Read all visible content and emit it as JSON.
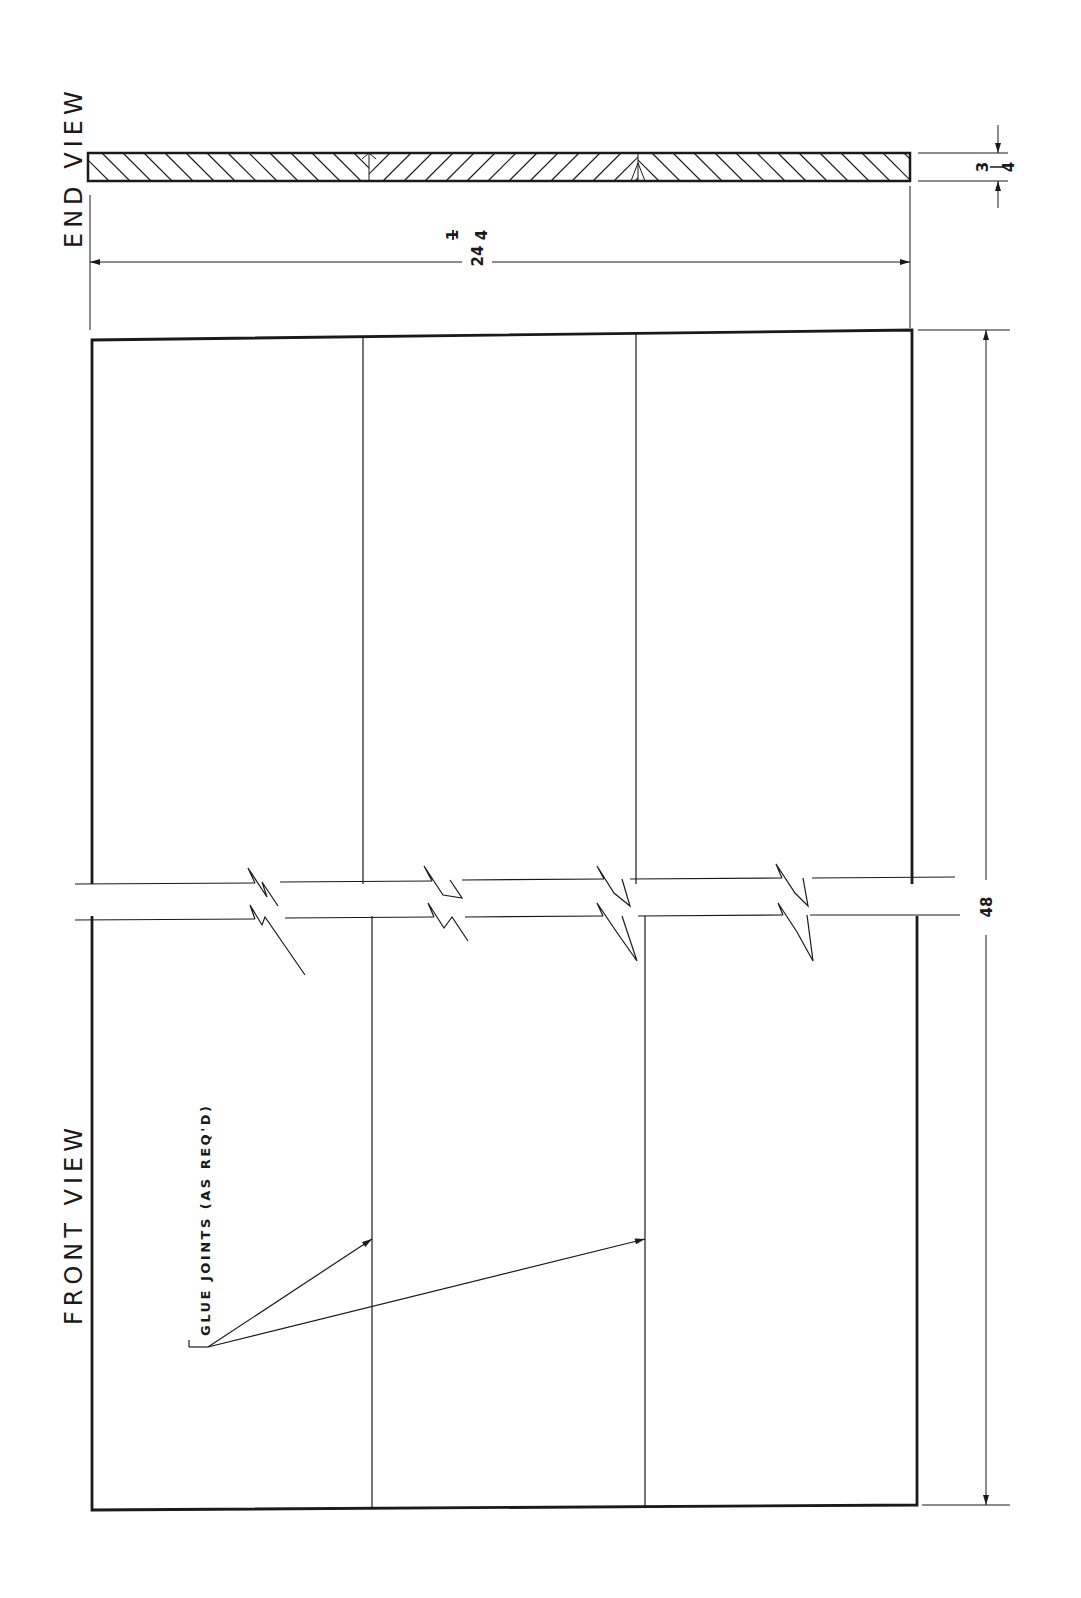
{
  "drawing": {
    "end_view": {
      "title": "END VIEW",
      "width_dim": {
        "whole": "24",
        "num": "1",
        "den": "4"
      },
      "thickness_dim": {
        "num": "3",
        "den": "4"
      }
    },
    "front_view": {
      "title": "FRONT VIEW",
      "length_dim": "48",
      "note": "GLUE JOINTS (AS REQ'D)",
      "board_count": 3
    },
    "colors": {
      "ink": "#1a1a1a",
      "paper": "#ffffff"
    }
  }
}
